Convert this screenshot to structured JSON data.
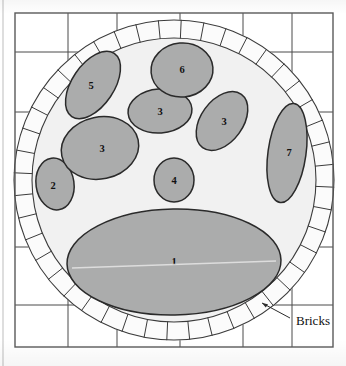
{
  "figure": {
    "kind": "archaeological-plan-diagram",
    "annotation_label": "Bricks",
    "colors": {
      "page_background": "#ffffff",
      "paving_fill": "#ffffff",
      "paving_line": "#4a4a4a",
      "frame_line": "#5a5a5a",
      "brick_fill": "#fbfbfb",
      "brick_line": "#3b3b3b",
      "circle_interior_fill": "#f1f1f1",
      "stone_fill": "#abacac",
      "stone_outline": "#2a2a2a",
      "label_text": "#111111"
    },
    "frame": {
      "x": 15,
      "y": 13,
      "width": 318,
      "height": 334
    },
    "page_edge_x": 3,
    "circle": {
      "cx": 174,
      "cy": 180,
      "outer_r": 160,
      "inner_r": 142
    },
    "brick_count": 44
  },
  "paving": {
    "horizontal_lines": [
      52,
      112,
      180,
      247,
      305
    ],
    "vertical_lines": [
      68,
      117,
      180,
      243,
      292
    ]
  },
  "stones": [
    {
      "id": "stone-1",
      "label": "1",
      "cx": 174,
      "cy": 262,
      "rx": 107,
      "ry": 53,
      "rot": -1,
      "label_x": 174,
      "label_y": 263
    },
    {
      "id": "stone-2",
      "label": "2",
      "cx": 55,
      "cy": 184,
      "rx": 19,
      "ry": 26,
      "rot": -8,
      "label_x": 53,
      "label_y": 187
    },
    {
      "id": "stone-3a",
      "label": "3",
      "cx": 100,
      "cy": 148,
      "rx": 39,
      "ry": 31,
      "rot": -12,
      "label_x": 102,
      "label_y": 150
    },
    {
      "id": "stone-3b",
      "label": "3",
      "cx": 160,
      "cy": 111,
      "rx": 32,
      "ry": 22,
      "rot": -4,
      "label_x": 160,
      "label_y": 113
    },
    {
      "id": "stone-3c",
      "label": "3",
      "cx": 222,
      "cy": 121,
      "rx": 21,
      "ry": 33,
      "rot": 36,
      "label_x": 224,
      "label_y": 123
    },
    {
      "id": "stone-4",
      "label": "4",
      "cx": 174,
      "cy": 180,
      "rx": 20,
      "ry": 22,
      "rot": 0,
      "label_x": 174,
      "label_y": 182
    },
    {
      "id": "stone-5",
      "label": "5",
      "cx": 93,
      "cy": 85,
      "rx": 21,
      "ry": 38,
      "rot": 34,
      "label_x": 91,
      "label_y": 87
    },
    {
      "id": "stone-6",
      "label": "6",
      "cx": 182,
      "cy": 70,
      "rx": 31,
      "ry": 27,
      "rot": -5,
      "label_x": 182,
      "label_y": 71
    },
    {
      "id": "stone-7",
      "label": "7",
      "cx": 287,
      "cy": 153,
      "rx": 19,
      "ry": 50,
      "rot": 8,
      "label_x": 289,
      "label_y": 154
    }
  ],
  "annotation": {
    "text": "Bricks",
    "text_x": 296,
    "text_y": 322,
    "leader_from_x": 290,
    "leader_from_y": 318,
    "leader_to_x": 262,
    "leader_to_y": 303
  }
}
